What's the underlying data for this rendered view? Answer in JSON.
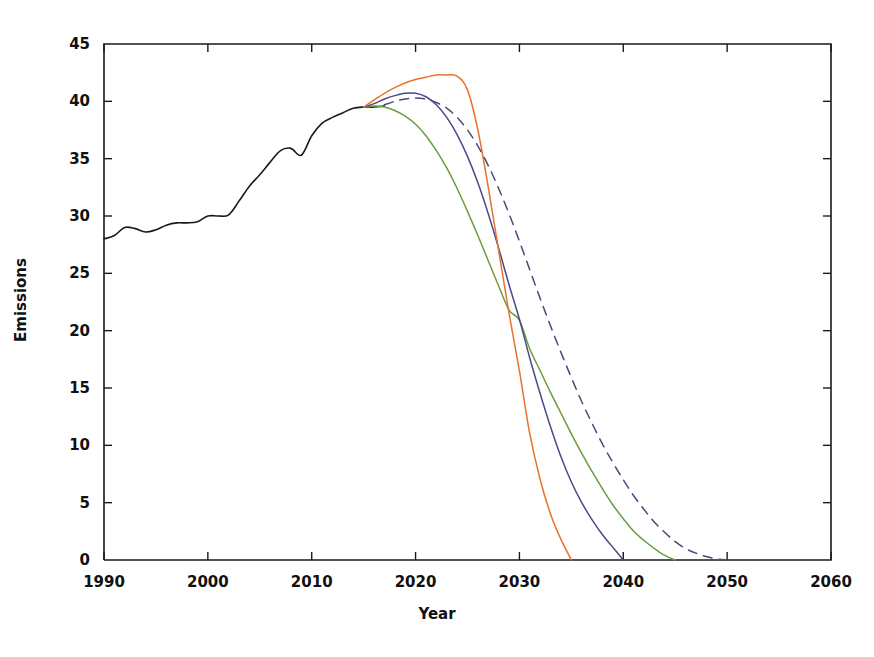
{
  "chart_data": {
    "type": "line",
    "title": "",
    "xlabel": "Year",
    "ylabel": "Emissions",
    "xlim": [
      1990,
      2060
    ],
    "ylim": [
      0,
      45
    ],
    "xticks": [
      1990,
      2000,
      2010,
      2020,
      2030,
      2040,
      2050,
      2060
    ],
    "xtick_labels": [
      "1990",
      "2000",
      "2010",
      "2020",
      "2030",
      "2040",
      "2050",
      "2060"
    ],
    "yticks": [
      0,
      5,
      10,
      15,
      20,
      25,
      30,
      35,
      40,
      45
    ],
    "ytick_labels": [
      "0",
      "5",
      "10",
      "15",
      "20",
      "25",
      "30",
      "35",
      "40",
      "45"
    ],
    "grid": false,
    "legend": "none",
    "series": [
      {
        "name": "historical",
        "color": "#1a1a1a",
        "style": "solid",
        "width": 1.6,
        "x": [
          1990,
          1991,
          1992,
          1993,
          1994,
          1995,
          1996,
          1997,
          1998,
          1999,
          2000,
          2001,
          2002,
          2003,
          2004,
          2005,
          2006,
          2007,
          2008,
          2009,
          2010,
          2011,
          2012,
          2013,
          2014,
          2015,
          2016,
          2017
        ],
        "y": [
          28.0,
          28.3,
          29.0,
          28.9,
          28.6,
          28.8,
          29.2,
          29.4,
          29.4,
          29.5,
          30.0,
          30.0,
          30.1,
          31.3,
          32.6,
          33.6,
          34.7,
          35.7,
          35.9,
          35.3,
          37.0,
          38.1,
          38.6,
          39.0,
          39.4,
          39.5,
          39.5,
          39.6
        ]
      },
      {
        "name": "green-scenario",
        "color": "#6a9e3a",
        "style": "solid",
        "width": 1.5,
        "x": [
          2015,
          2016,
          2017,
          2018,
          2019,
          2020,
          2021,
          2022,
          2023,
          2024,
          2025,
          2026,
          2027,
          2028,
          2029,
          2030,
          2031,
          2032,
          2033,
          2034,
          2035,
          2036,
          2037,
          2038,
          2039,
          2040,
          2041,
          2042,
          2043,
          2044,
          2045
        ],
        "y": [
          39.5,
          39.6,
          39.5,
          39.2,
          38.7,
          38.0,
          37.0,
          35.7,
          34.2,
          32.4,
          30.4,
          28.3,
          26.1,
          23.9,
          21.8,
          20.9,
          18.4,
          16.5,
          14.6,
          12.8,
          11.0,
          9.3,
          7.7,
          6.2,
          4.8,
          3.6,
          2.5,
          1.7,
          1.0,
          0.4,
          0.0
        ]
      },
      {
        "name": "navy-scenario",
        "color": "#4a4a8a",
        "style": "solid",
        "width": 1.5,
        "x": [
          2015,
          2016,
          2017,
          2018,
          2019,
          2020,
          2021,
          2022,
          2023,
          2024,
          2025,
          2026,
          2027,
          2028,
          2029,
          2030,
          2031,
          2032,
          2033,
          2034,
          2035,
          2036,
          2037,
          2038,
          2039,
          2040
        ],
        "y": [
          39.5,
          39.8,
          40.2,
          40.5,
          40.7,
          40.7,
          40.4,
          39.7,
          38.6,
          37.1,
          35.2,
          32.9,
          30.2,
          27.2,
          24.0,
          21.0,
          17.6,
          14.5,
          11.6,
          9.0,
          6.8,
          5.0,
          3.5,
          2.2,
          1.1,
          0.0
        ]
      },
      {
        "name": "orange-scenario",
        "color": "#e8722c",
        "style": "solid",
        "width": 1.5,
        "x": [
          2015,
          2016,
          2017,
          2018,
          2019,
          2020,
          2021,
          2022,
          2023,
          2024,
          2025,
          2026,
          2027,
          2028,
          2029,
          2030,
          2031,
          2032,
          2033,
          2034,
          2035
        ],
        "y": [
          39.5,
          40.1,
          40.7,
          41.2,
          41.6,
          41.9,
          42.1,
          42.3,
          42.3,
          42.2,
          41.0,
          37.5,
          32.5,
          27.0,
          21.5,
          16.5,
          11.0,
          7.0,
          4.0,
          1.8,
          0.0
        ]
      },
      {
        "name": "dashed-scenario",
        "color": "#4a4a7a",
        "style": "dashed",
        "width": 1.5,
        "x": [
          2017,
          2018,
          2019,
          2020,
          2021,
          2022,
          2023,
          2024,
          2025,
          2026,
          2027,
          2028,
          2029,
          2030,
          2031,
          2032,
          2033,
          2034,
          2035,
          2036,
          2037,
          2038,
          2039,
          2040,
          2041,
          2042,
          2043,
          2044,
          2045,
          2046,
          2047,
          2048,
          2049,
          2050
        ],
        "y": [
          39.7,
          40.0,
          40.2,
          40.3,
          40.2,
          39.9,
          39.4,
          38.6,
          37.5,
          36.1,
          34.4,
          32.4,
          30.2,
          27.8,
          25.3,
          22.8,
          20.4,
          18.1,
          15.9,
          13.8,
          11.9,
          10.1,
          8.5,
          7.0,
          5.6,
          4.4,
          3.3,
          2.4,
          1.6,
          1.0,
          0.6,
          0.3,
          0.1,
          0.0
        ]
      }
    ]
  }
}
